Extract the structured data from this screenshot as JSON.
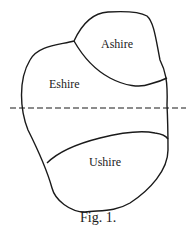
{
  "figure": {
    "caption": "Fig. 1.",
    "regions": [
      {
        "name": "Ashire"
      },
      {
        "name": "Eshire"
      },
      {
        "name": "Ushire"
      }
    ],
    "divider": "dashed horizontal line"
  }
}
